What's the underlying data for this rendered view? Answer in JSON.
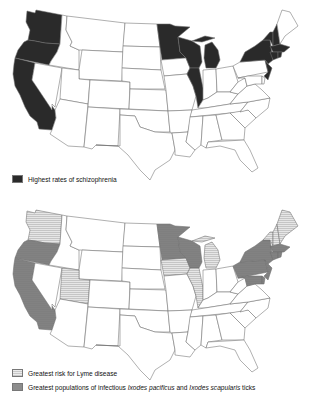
{
  "maps": [
    {
      "id": "schizophrenia",
      "legend": [
        {
          "label": "Highest rates of schizophrenia",
          "fill": "dark",
          "color": "#2a2a2a"
        }
      ],
      "shaded_states": {
        "dark": [
          "WA",
          "OR",
          "CA",
          "MN",
          "WI",
          "MI",
          "IL",
          "NY",
          "NJ",
          "VT",
          "NH",
          "MA",
          "CT",
          "RI"
        ]
      }
    },
    {
      "id": "lyme",
      "legend": [
        {
          "label": "Greatest risk for Lyme disease",
          "fill": "light-striped",
          "color": "#d4d4d4"
        },
        {
          "label_parts": [
            "Greatest populations of infectious ",
            "Ixodes pacificus",
            " and ",
            "Ixodes scapularis",
            " ticks"
          ],
          "fill": "mid-dotted",
          "color": "#7a7a7a"
        }
      ],
      "shaded_states": {
        "light": [
          "WA",
          "UT",
          "IA",
          "IL",
          "MI",
          "ME",
          "NH",
          "VT"
        ],
        "mid": [
          "OR",
          "CA",
          "MN",
          "WI",
          "NY",
          "PA",
          "NJ",
          "MD",
          "DE",
          "MA",
          "CT",
          "RI"
        ]
      }
    }
  ],
  "colors": {
    "dark": "#2a2a2a",
    "light": "#d4d4d4",
    "mid": "#7a7a7a",
    "none": "#ffffff",
    "border": "#6e6e6e"
  }
}
